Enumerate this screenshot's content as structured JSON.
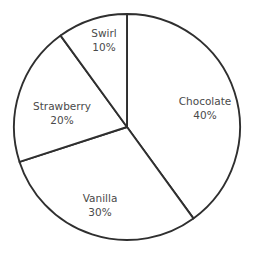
{
  "chart_data": {
    "type": "pie",
    "title": "",
    "subtitle": "",
    "xlabel": "",
    "ylabel": "",
    "grid": false,
    "legend": "none",
    "labels_inside_slices": true,
    "start_angle_deg": 0,
    "direction": "clockwise",
    "categories": [
      "Chocolate",
      "Vanilla",
      "Strawberry",
      "Swirl"
    ],
    "values": [
      40,
      30,
      20,
      10
    ],
    "value_unit": "%",
    "slices": [
      {
        "name": "Chocolate",
        "value": 40,
        "value_text": "40%",
        "start_deg": 0,
        "end_deg": 144,
        "label_x": 205,
        "label_y": 108,
        "fill": "#ffffff",
        "stroke": "#2f2f2f"
      },
      {
        "name": "Vanilla",
        "value": 30,
        "value_text": "30%",
        "start_deg": 144,
        "end_deg": 252,
        "label_x": 100,
        "label_y": 205,
        "fill": "#ffffff",
        "stroke": "#2f2f2f"
      },
      {
        "name": "Strawberry",
        "value": 20,
        "value_text": "20%",
        "start_deg": 252,
        "end_deg": 324,
        "label_x": 62,
        "label_y": 113,
        "fill": "#ffffff",
        "stroke": "#2f2f2f"
      },
      {
        "name": "Swirl",
        "value": 10,
        "value_text": "10%",
        "start_deg": 324,
        "end_deg": 360,
        "label_x": 104,
        "label_y": 40,
        "fill": "#ffffff",
        "stroke": "#2f2f2f"
      }
    ],
    "geometry": {
      "center_x": 127,
      "center_y": 127,
      "radius": 113
    },
    "colors": {
      "background": "#ffffff",
      "stroke": "#2f2f2f",
      "label_text": "#4a4a4a"
    }
  }
}
